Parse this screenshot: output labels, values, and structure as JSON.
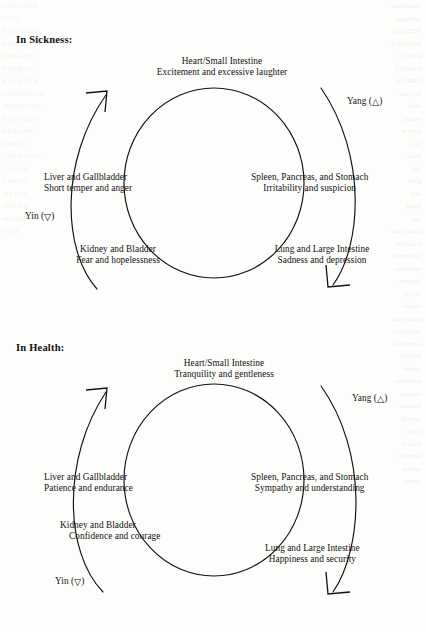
{
  "document": {
    "title": "Yin and Yang Organ Cycles In Sickness and In Health",
    "ink_color": "#111111",
    "paper_color": "#fdfdfb",
    "bleed_text_left": "CHAPTER\nFIVE\nELEMENT\nTHEORY\nORGANS\nENERGY\nBALANCE\nCHANNELS\nMERIDIAN\nEMOTION\nHEALTH\nSPIRIT\nCHI FLOW\nCYCLE\nEARTH\nMETAL\nWATER\nWOOD\nFIRE",
    "bleed_text_right": "emotions\nlaughter\nSPLEEN\nKIDNEY\nLIVER\nLUNGS\nHEART\nsorrow\nfear\nanger\nworry\njoy\nshen\nchi\njing\nyin\nyang\ntao\nwu hsing\nbalance\nharmony\nelement\nenergy\ncycle\norgan\nmeridian\nacupoint\nsickness\nhealth\nvirtue\nemotion\nnature\nseason\nflavor\ncolor\nsound\nclimate\ntissue\nsense"
  },
  "sections": [
    {
      "id": "sickness",
      "title": "In Sickness:",
      "yang_label": "Yang (",
      "yang_symbol": "△",
      "yang_label_close": ")",
      "yin_label": "Yin (",
      "yin_symbol": "▽",
      "yin_label_close": ")",
      "nodes": [
        {
          "position": "top",
          "organ": "Heart/Small Intestine",
          "quality": "Excitement and excessive laughter"
        },
        {
          "position": "left",
          "organ": "Liver and Gallbladder",
          "quality": "Short temper and anger"
        },
        {
          "position": "right",
          "organ": "Spleen, Pancreas, and Stomach",
          "quality": "Irritability and suspicion"
        },
        {
          "position": "bottom-left",
          "organ": "Kidney and Bladder",
          "quality": "Fear and hopelessness"
        },
        {
          "position": "bottom-right",
          "organ": "Lung and Large Intestine",
          "quality": "Sadness and depression"
        }
      ]
    },
    {
      "id": "health",
      "title": "In Health:",
      "yang_label": "Yang (",
      "yang_symbol": "△",
      "yang_label_close": ")",
      "yin_label": "Yin (",
      "yin_symbol": "▽",
      "yin_label_close": ")",
      "nodes": [
        {
          "position": "top",
          "organ": "Heart/Small Intestine",
          "quality": "Tranquility and gentleness"
        },
        {
          "position": "left",
          "organ": "Liver and Gallbladder",
          "quality": "Patience and endurance"
        },
        {
          "position": "right",
          "organ": "Spleen, Pancreas, and Stomach",
          "quality": "Sympathy and understanding"
        },
        {
          "position": "bottom-left",
          "organ": "Kidney and Bladder",
          "quality": "Confidence and courage"
        },
        {
          "position": "bottom-right",
          "organ": "Lung and Large Intestine",
          "quality": "Happiness and security"
        }
      ]
    }
  ]
}
